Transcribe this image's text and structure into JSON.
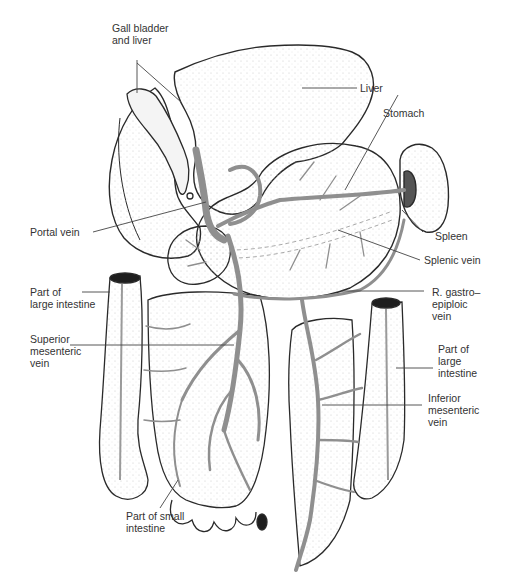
{
  "figure": {
    "colors": {
      "ink": "#2a2a2a",
      "vein": "#9a9a9a",
      "stipple": "#bdbdbd",
      "background": "#ffffff"
    }
  },
  "labels": {
    "gall_bladder_liver": {
      "line1": "Gall bladder",
      "line2": "and liver"
    },
    "liver": {
      "line1": "Liver"
    },
    "stomach": {
      "line1": "Stomach"
    },
    "portal_vein": {
      "line1": "Portal vein"
    },
    "spleen": {
      "line1": "Spleen"
    },
    "splenic_vein": {
      "line1": "Splenic vein"
    },
    "large_intestine_left": {
      "line1": "Part of",
      "line2": "large intestine"
    },
    "r_gastroepiploic_vein": {
      "line1": "R. gastro–",
      "line2": "epiploic",
      "line3": "vein"
    },
    "superior_mesenteric_vein": {
      "line1": "Superior",
      "line2": "mesenteric",
      "line3": "vein"
    },
    "large_intestine_right": {
      "line1": "Part of",
      "line2": "large",
      "line3": "intestine"
    },
    "inferior_mesenteric_vein": {
      "line1": "Inferior",
      "line2": "mesenteric",
      "line3": "vein"
    },
    "small_intestine": {
      "line1": "Part of small",
      "line2": "intestine"
    }
  }
}
